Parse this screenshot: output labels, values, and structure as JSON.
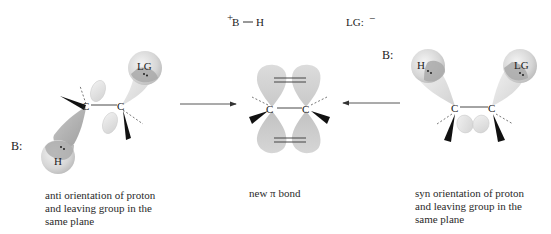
{
  "figure": {
    "top_labels": {
      "protonated_base": "+B — H",
      "protonated_base_charge": "+",
      "protonated_base_text": "B",
      "protonated_base_h": "H",
      "leaving_group": "LG:",
      "leaving_group_charge": "−"
    },
    "anti": {
      "base_label": "B:",
      "carbon_left": "C",
      "carbon_right": "C",
      "hydrogen": "H",
      "leaving_group": "LG",
      "caption_lines": [
        "anti orientation of proton",
        "and leaving group in the",
        "same plane"
      ]
    },
    "product": {
      "carbon_left": "C",
      "carbon_right": "C",
      "caption": "new π bond"
    },
    "syn": {
      "base_label": "B:",
      "carbon_left": "C",
      "carbon_right": "C",
      "hydrogen": "H",
      "leaving_group": "LG",
      "caption_lines": [
        "syn orientation of proton",
        "and leaving group in the",
        "same plane"
      ]
    },
    "arrows": [
      {
        "from": "anti",
        "to": "product",
        "direction": "right"
      },
      {
        "from": "syn",
        "to": "product",
        "direction": "left"
      }
    ],
    "colors": {
      "orbital_light": "#e6e6e6",
      "orbital_mid": "#cfcfcf",
      "orbital_dark": "#a8a8a8",
      "wedge": "#111111",
      "text": "#222222"
    }
  }
}
